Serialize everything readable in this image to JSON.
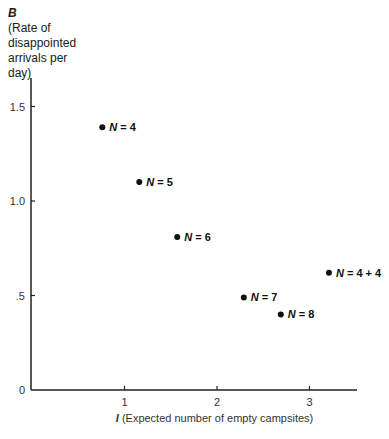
{
  "chart_data": {
    "type": "scatter",
    "title": "",
    "ylabel": {
      "variable": "B",
      "description": "(Rate of disappointed arrivals per day)"
    },
    "xlabel": {
      "variable": "I",
      "description": "(Expected number of empty campsites)"
    },
    "x_ticks": [
      "1",
      "2",
      "3"
    ],
    "y_ticks": [
      "0",
      ".5",
      "1.0",
      "1.5"
    ],
    "xlim": [
      0,
      3.5
    ],
    "ylim": [
      0,
      1.65
    ],
    "grid": false,
    "legend": null,
    "points": [
      {
        "label": "N = 4",
        "n_var": "N",
        "n_val": "= 4",
        "x": 0.76,
        "y": 1.39
      },
      {
        "label": "N = 5",
        "n_var": "N",
        "n_val": "= 5",
        "x": 1.16,
        "y": 1.1
      },
      {
        "label": "N = 6",
        "n_var": "N",
        "n_val": "= 6",
        "x": 1.57,
        "y": 0.81
      },
      {
        "label": "N = 7",
        "n_var": "N",
        "n_val": "= 7",
        "x": 2.29,
        "y": 0.49
      },
      {
        "label": "N = 8",
        "n_var": "N",
        "n_val": "= 8",
        "x": 2.69,
        "y": 0.4
      },
      {
        "label": "N = 4 + 4",
        "n_var": "N",
        "n_val": "= 4 + 4",
        "x": 3.21,
        "y": 0.62
      }
    ]
  }
}
